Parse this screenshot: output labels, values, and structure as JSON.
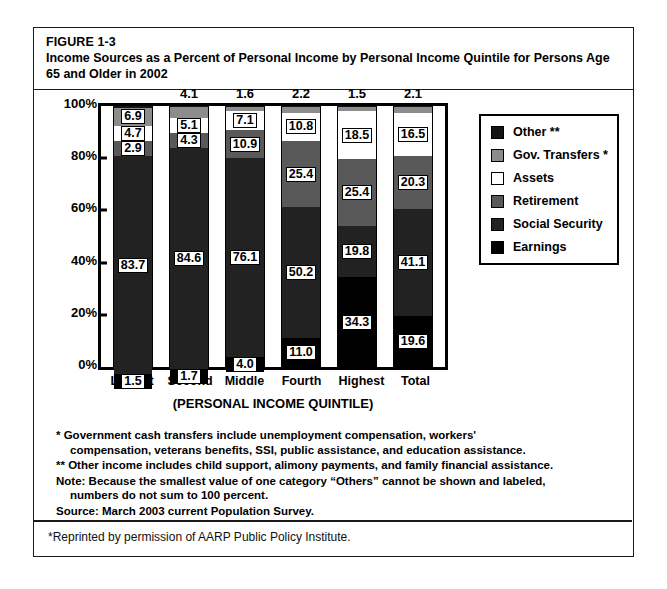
{
  "figure": {
    "number": "FIGURE 1-3",
    "title": "Income Sources as a Percent of Personal Income by Personal Income Quintile for Persons Age 65 and Older in 2002"
  },
  "chart_data": {
    "type": "bar",
    "stacked": true,
    "title": "Income Sources as a Percent of Personal Income by Personal Income Quintile for Persons Age 65 and Older in 2002",
    "xlabel": "(PERSONAL INCOME QUINTILE)",
    "ylabel": "",
    "ylim": [
      0,
      100
    ],
    "grid": false,
    "legend_position": "right",
    "categories": [
      "Lowest",
      "Second",
      "Middle",
      "Fourth",
      "Highest",
      "Total"
    ],
    "ytick_labels": [
      "100%",
      "80%",
      "60%",
      "40%",
      "20%",
      "0%"
    ],
    "ytick_values": [
      100,
      80,
      60,
      40,
      20,
      0
    ],
    "series": [
      {
        "name": "Other **",
        "color": "#141414",
        "values": [
          0.7,
          0.5,
          0.5,
          0.4,
          0.5,
          0.4
        ],
        "labels": [
          "",
          "",
          "",
          "",
          "",
          ""
        ]
      },
      {
        "name": "Gov. Transfers *",
        "color": "#8c8c8c",
        "values": [
          6.9,
          4.1,
          1.6,
          2.2,
          1.5,
          2.1
        ],
        "labels": [
          "6.9",
          "4.1",
          "1.6",
          "2.2",
          "1.5",
          "2.1"
        ],
        "label_position": [
          "inside",
          "above",
          "above",
          "above",
          "above",
          "above"
        ]
      },
      {
        "name": "Assets",
        "color": "#ffffff",
        "values": [
          4.7,
          5.1,
          7.1,
          10.8,
          18.5,
          16.5
        ],
        "labels": [
          "4.7",
          "5.1",
          "7.1",
          "10.8",
          "18.5",
          "16.5"
        ],
        "label_position": [
          "inside",
          "inside",
          "inside",
          "inside",
          "inside",
          "inside"
        ]
      },
      {
        "name": "Retirement",
        "color": "#595959",
        "values": [
          2.9,
          4.3,
          10.9,
          25.4,
          25.4,
          20.3
        ],
        "labels": [
          "2.9",
          "4.3",
          "10.9",
          "25.4",
          "25.4",
          "20.3"
        ],
        "label_position": [
          "inside",
          "inside",
          "inside",
          "inside",
          "inside",
          "inside"
        ]
      },
      {
        "name": "Social Security",
        "color": "#222222",
        "values": [
          83.7,
          84.6,
          76.1,
          50.2,
          19.8,
          41.1
        ],
        "labels": [
          "83.7",
          "84.6",
          "76.1",
          "50.2",
          "19.8",
          "41.1"
        ],
        "label_position": [
          "inside",
          "inside",
          "inside",
          "inside",
          "inside",
          "inside"
        ]
      },
      {
        "name": "Earnings",
        "color": "#000000",
        "values": [
          1.5,
          1.7,
          4.0,
          11.0,
          34.3,
          19.6
        ],
        "labels": [
          "1.5",
          "1.7",
          "4.0",
          "11.0",
          "34.3",
          "19.6"
        ],
        "label_position": [
          "inside",
          "inside",
          "inside",
          "inside",
          "inside",
          "inside"
        ]
      }
    ]
  },
  "legend": {
    "items": [
      {
        "label": "Other **",
        "color": "#141414"
      },
      {
        "label": "Gov. Transfers *",
        "color": "#8c8c8c"
      },
      {
        "label": "Assets",
        "color": "#ffffff"
      },
      {
        "label": "Retirement",
        "color": "#595959"
      },
      {
        "label": "Social Security",
        "color": "#222222"
      },
      {
        "label": "Earnings",
        "color": "#000000"
      }
    ]
  },
  "notes": {
    "line1a": "* Government cash transfers include unemployment compensation, workers'",
    "line1b": "compensation, veterans benefits, SSI, public assistance, and education assistance.",
    "line2": "** Other income includes child support, alimony payments, and family financial assistance.",
    "line3a": "Note: Because the smallest value of one category “Others” cannot be shown and labeled,",
    "line3b": "numbers do not sum to 100 percent.",
    "line4": "Source: March 2003 current Population Survey."
  },
  "reprint": "*Reprinted by permission of AARP Public Policy Institute."
}
